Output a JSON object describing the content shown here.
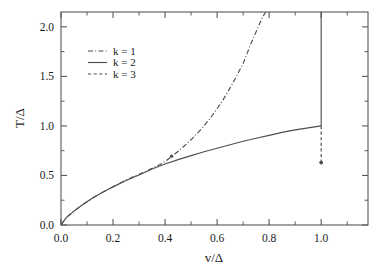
{
  "chart_data": {
    "type": "line",
    "title": "",
    "xlabel": "v/Δ",
    "ylabel": "T/Δ",
    "xlim": [
      0.0,
      1.18
    ],
    "ylim": [
      0.0,
      2.15
    ],
    "grid": false,
    "legend_position": "upper-left-inside",
    "xticks": [
      0.0,
      0.2,
      0.4,
      0.6,
      0.8,
      1.0
    ],
    "xticklabels": [
      "0.0",
      "0.2",
      "0.4",
      "0.6",
      "0.8",
      "1.0"
    ],
    "xticks_minor": [
      0.1,
      0.3,
      0.5,
      0.7,
      0.9,
      1.1
    ],
    "yticks": [
      0.0,
      0.5,
      1.0,
      1.5,
      2.0
    ],
    "yticklabels": [
      "0.0",
      "0.5",
      "1.0",
      "1.5",
      "2.0"
    ],
    "yticks_minor": [
      0.25,
      0.75,
      1.25,
      1.75
    ],
    "series": [
      {
        "name": "k = 1",
        "style": "dashdot",
        "color": "#4a4f53",
        "x": [
          0.0,
          0.02,
          0.05,
          0.08,
          0.12,
          0.16,
          0.2,
          0.24,
          0.28,
          0.32,
          0.34,
          0.36,
          0.38,
          0.4,
          0.43,
          0.46,
          0.5,
          0.54,
          0.58,
          0.62,
          0.66,
          0.7,
          0.73,
          0.755,
          0.775,
          0.787
        ],
        "y": [
          0.0,
          0.075,
          0.14,
          0.2,
          0.27,
          0.33,
          0.385,
          0.44,
          0.49,
          0.535,
          0.56,
          0.585,
          0.61,
          0.64,
          0.7,
          0.765,
          0.86,
          0.97,
          1.1,
          1.25,
          1.43,
          1.63,
          1.83,
          1.98,
          2.1,
          2.15
        ]
      },
      {
        "name": "k = 2",
        "style": "solid",
        "color": "#4a4f53",
        "x": [
          0.0,
          0.02,
          0.05,
          0.08,
          0.12,
          0.16,
          0.2,
          0.25,
          0.3,
          0.35,
          0.4,
          0.45,
          0.5,
          0.55,
          0.6,
          0.65,
          0.7,
          0.75,
          0.8,
          0.85,
          0.9,
          0.95,
          1.0
        ],
        "y": [
          0.0,
          0.075,
          0.14,
          0.2,
          0.27,
          0.33,
          0.385,
          0.45,
          0.505,
          0.565,
          0.615,
          0.66,
          0.7,
          0.74,
          0.775,
          0.81,
          0.845,
          0.875,
          0.905,
          0.935,
          0.96,
          0.98,
          1.0
        ]
      },
      {
        "name": "k = 3",
        "style": "dashed",
        "color": "#4a4f53",
        "x": [
          1.0,
          1.0
        ],
        "y": [
          1.0,
          0.63
        ],
        "endpoint_marker": {
          "x": 1.0,
          "y": 0.63
        }
      }
    ],
    "annotations": [
      {
        "type": "vertical-line",
        "x": 1.0,
        "y_from": 1.0,
        "y_to": 2.15,
        "style": "solid"
      },
      {
        "type": "point-marker",
        "x": 0.425,
        "y": 0.695
      }
    ]
  },
  "legend": {
    "entries": [
      {
        "label": "k = 1",
        "style": "dashdot"
      },
      {
        "label": "k = 2",
        "style": "solid"
      },
      {
        "label": "k = 3",
        "style": "dashed"
      }
    ]
  },
  "axes": {
    "x_label": "v/Δ",
    "y_label": "T/Δ"
  }
}
